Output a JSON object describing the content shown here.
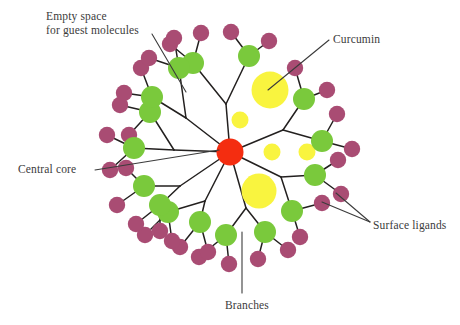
{
  "figure": {
    "width": 460,
    "height": 325,
    "background": "#ffffff"
  },
  "colors": {
    "core": "#f42d10",
    "branch_node": "#7ac93c",
    "surface_ligand": "#a94c73",
    "guest_molecule": "#f9f43f",
    "bond": "#23201f",
    "leader": "#3b3b3b",
    "text": "#3b3b3b"
  },
  "labels": [
    {
      "id": "empty-space",
      "lines": [
        "Empty space",
        "for guest molecules"
      ],
      "x": 46,
      "y": 10,
      "align": "left",
      "leader": {
        "x1": 152,
        "y1": 34,
        "x2": 186,
        "y2": 92
      }
    },
    {
      "id": "curcumin",
      "lines": [
        "Curcumin"
      ],
      "x": 333,
      "y": 33,
      "align": "left",
      "leader": {
        "x1": 329,
        "y1": 40,
        "x2": 268,
        "y2": 90
      }
    },
    {
      "id": "central-core",
      "lines": [
        "Central core"
      ],
      "x": 18,
      "y": 163,
      "align": "left",
      "leader": {
        "x1": 95,
        "y1": 170,
        "x2": 219,
        "y2": 150
      }
    },
    {
      "id": "surface-ligands",
      "lines": [
        "Surface ligands"
      ],
      "x": 373,
      "y": 219,
      "align": "left",
      "leader_multi": [
        {
          "x1": 370,
          "y1": 222,
          "x2": 322,
          "y2": 202
        },
        {
          "x1": 370,
          "y1": 222,
          "x2": 336,
          "y2": 193
        }
      ]
    },
    {
      "id": "branches",
      "lines": [
        "Branches"
      ],
      "x": 225,
      "y": 299,
      "align": "left",
      "leader": {
        "x1": 242,
        "y1": 293,
        "x2": 242,
        "y2": 232
      }
    }
  ],
  "core": {
    "name": "central-core",
    "cx": 230,
    "cy": 152,
    "r": 13.5
  },
  "guest_molecules": [
    {
      "name": "curcumin-blob-large-upper",
      "cx": 270,
      "cy": 90,
      "r": 18.5
    },
    {
      "name": "curcumin-blob-small-upper",
      "cx": 240,
      "cy": 120,
      "r": 8.5
    },
    {
      "name": "curcumin-blob-small-mid-a",
      "cx": 272,
      "cy": 152,
      "r": 8.5
    },
    {
      "name": "curcumin-blob-small-mid-b",
      "cx": 307,
      "cy": 152,
      "r": 8.5
    },
    {
      "name": "curcumin-blob-large-lower",
      "cx": 259,
      "cy": 191,
      "r": 17.5
    }
  ],
  "branches": [
    {
      "id": "branch-n",
      "fork": {
        "x": 226,
        "y": 104
      },
      "nodes": [
        {
          "cx": 193,
          "cy": 63,
          "ligands": [
            {
              "cx": 170,
              "cy": 44
            },
            {
              "cx": 201,
              "cy": 33
            }
          ]
        },
        {
          "cx": 249,
          "cy": 56,
          "ligands": [
            {
              "cx": 231,
              "cy": 32
            },
            {
              "cx": 269,
              "cy": 41
            }
          ]
        }
      ]
    },
    {
      "id": "branch-ne",
      "fork": {
        "x": 283,
        "y": 130
      },
      "nodes": [
        {
          "cx": 304,
          "cy": 99,
          "ligands": [
            {
              "cx": 295,
              "cy": 68
            },
            {
              "cx": 327,
              "cy": 90
            }
          ]
        },
        {
          "cx": 322,
          "cy": 141,
          "ligands": [
            {
              "cx": 337,
              "cy": 114
            },
            {
              "cx": 352,
              "cy": 149
            }
          ]
        }
      ]
    },
    {
      "id": "branch-e",
      "fork": {
        "x": 281,
        "y": 177
      },
      "nodes": [
        {
          "cx": 315,
          "cy": 175,
          "ligands": [
            {
              "cx": 338,
              "cy": 160
            },
            {
              "cx": 341,
              "cy": 194
            }
          ]
        },
        {
          "cx": 292,
          "cy": 211,
          "ligands": [
            {
              "cx": 322,
              "cy": 203
            },
            {
              "cx": 300,
              "cy": 237
            }
          ]
        }
      ]
    },
    {
      "id": "branch-se",
      "fork": {
        "x": 246,
        "y": 208
      },
      "nodes": [
        {
          "cx": 265,
          "cy": 232,
          "ligands": [
            {
              "cx": 288,
              "cy": 250
            },
            {
              "cx": 258,
              "cy": 259
            }
          ]
        },
        {
          "cx": 226,
          "cy": 235,
          "ligands": [
            {
              "cx": 229,
              "cy": 264
            },
            {
              "cx": 199,
              "cy": 257
            }
          ]
        }
      ]
    },
    {
      "id": "branch-s",
      "fork": {
        "x": 205,
        "y": 201
      },
      "nodes": [
        {
          "cx": 200,
          "cy": 222,
          "ligands": [
            {
              "cx": 180,
              "cy": 247
            },
            {
              "cx": 208,
              "cy": 252
            }
          ]
        },
        {
          "cx": 168,
          "cy": 212,
          "ligands": [
            {
              "cx": 145,
              "cy": 235
            },
            {
              "cx": 172,
              "cy": 241
            }
          ]
        }
      ]
    },
    {
      "id": "branch-sw",
      "fork": {
        "x": 180,
        "y": 186
      },
      "nodes": [
        {
          "cx": 144,
          "cy": 186,
          "ligands": [
            {
              "cx": 117,
              "cy": 205
            },
            {
              "cx": 126,
              "cy": 168
            }
          ]
        },
        {
          "cx": 160,
          "cy": 205,
          "ligands": [
            {
              "cx": 136,
              "cy": 224
            },
            {
              "cx": 160,
              "cy": 231
            }
          ]
        }
      ]
    },
    {
      "id": "branch-w",
      "fork": {
        "x": 174,
        "y": 150
      },
      "nodes": [
        {
          "cx": 134,
          "cy": 148,
          "ligands": [
            {
              "cx": 107,
              "cy": 135
            },
            {
              "cx": 110,
              "cy": 170
            }
          ]
        },
        {
          "cx": 150,
          "cy": 112,
          "ligands": [
            {
              "cx": 120,
              "cy": 105
            },
            {
              "cx": 129,
              "cy": 135
            }
          ]
        }
      ]
    },
    {
      "id": "branch-nw",
      "fork": {
        "x": 186,
        "y": 118
      },
      "nodes": [
        {
          "cx": 152,
          "cy": 97,
          "ligands": [
            {
              "cx": 124,
              "cy": 93
            },
            {
              "cx": 141,
              "cy": 68
            }
          ]
        },
        {
          "cx": 179,
          "cy": 68,
          "ligands": [
            {
              "cx": 149,
              "cy": 58
            },
            {
              "cx": 174,
              "cy": 38
            }
          ]
        }
      ]
    }
  ],
  "geometry": {
    "branch_node_radius": 11,
    "ligand_radius": 8.2
  }
}
